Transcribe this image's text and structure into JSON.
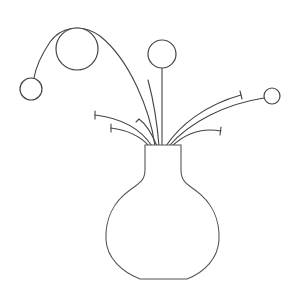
{
  "illustration": {
    "subject": "vase-with-flowers",
    "colors": {
      "background": "#ffffff",
      "stroke": "#444444"
    },
    "vase": {
      "neck": {
        "left_x": 145,
        "right_x": 181,
        "top_y": 145,
        "shoulder_y": 175
      },
      "bowl": {
        "left_x": 106,
        "right_x": 219,
        "bottom_y": 279,
        "base_left_x": 140,
        "base_right_x": 187
      }
    },
    "blooms": [
      {
        "name": "large-bloom",
        "cx": 77,
        "cy": 49,
        "r": 21
      },
      {
        "name": "small-left-bloom",
        "cx": 31,
        "cy": 89,
        "r": 11
      },
      {
        "name": "center-bloom",
        "cx": 162,
        "cy": 54,
        "r": 14
      },
      {
        "name": "right-bloom",
        "cx": 272,
        "cy": 96,
        "r": 8
      }
    ],
    "stem_count": 9
  }
}
